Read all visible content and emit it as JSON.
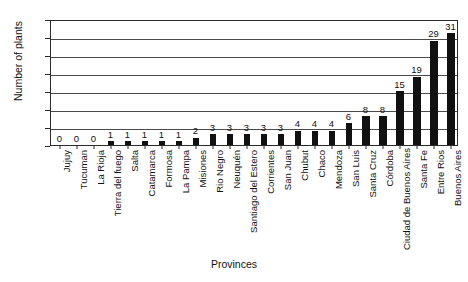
{
  "chart_data": {
    "type": "bar",
    "title": "",
    "xlabel": "Provinces",
    "ylabel": "Number of plants",
    "ylim": [
      0,
      35
    ],
    "yticks": [
      0,
      5,
      10,
      15,
      20,
      25,
      30,
      35
    ],
    "grid": true,
    "legend": null,
    "orientation": "vertical",
    "bar_color": "#111111",
    "categories": [
      "Jujuy",
      "Tucuman",
      "La Rioja",
      "Tierra del fuego",
      "Salta",
      "Catamarca",
      "Formosa",
      "La Pampa",
      "Misiones",
      "Rio Negro",
      "Neuquén",
      "Santiago del Estero",
      "Corrientes",
      "San Juan",
      "Chubut",
      "Chaco",
      "Mendoza",
      "San Luis",
      "Santa Cruz",
      "Córdoba",
      "Ciudad de Buenos Aires",
      "Santa Fe",
      "Entre Rios",
      "Buenos Aires"
    ],
    "values": [
      0,
      0,
      0,
      1,
      1,
      1,
      1,
      1,
      2,
      3,
      3,
      3,
      3,
      3,
      4,
      4,
      4,
      6,
      8,
      8,
      15,
      19,
      29,
      31
    ],
    "data_labels": [
      "0",
      "0",
      "0",
      "1",
      "1",
      "1",
      "1",
      "1",
      "2",
      "3",
      "3",
      "3",
      "3",
      "3",
      "4",
      "4",
      "4",
      "6",
      "8",
      "8",
      "15",
      "19",
      "29",
      "31"
    ]
  }
}
